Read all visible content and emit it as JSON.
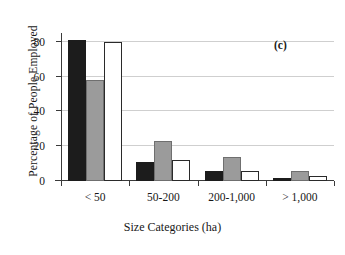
{
  "chart_data": {
    "type": "bar",
    "title": "",
    "panel_label": "(c)",
    "xlabel": "Size Categories (ha)",
    "ylabel": "Percentage of People Employed",
    "categories": [
      "< 50",
      "50-200",
      "200-1,000",
      "> 1,000"
    ],
    "series": [
      {
        "name": "series-1",
        "color": "#1c1c1c",
        "fill": "black",
        "values": [
          81,
          11,
          6,
          2
        ]
      },
      {
        "name": "series-2",
        "color": "#9b9b9b",
        "fill": "gray",
        "values": [
          58,
          23,
          14,
          6
        ]
      },
      {
        "name": "series-3",
        "color": "#ffffff",
        "fill": "white",
        "values": [
          80,
          12,
          6,
          3
        ]
      }
    ],
    "ylim": [
      0,
      85
    ],
    "yticks": [
      0,
      20,
      40,
      60,
      80
    ],
    "ytick_labels": [
      "0",
      "20",
      "40",
      "60",
      "80"
    ],
    "grid": true,
    "grid_axis": "y",
    "legend": "none",
    "legend_position": "none"
  }
}
